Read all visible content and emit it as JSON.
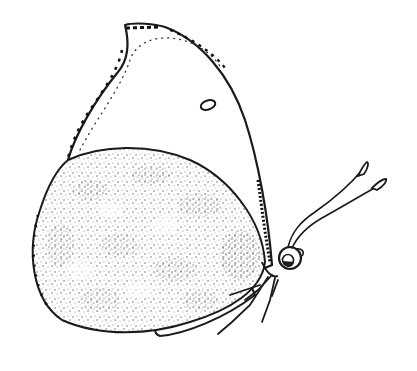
{
  "image": {
    "subject": "Butterfly, lateral (side) view, line drawing with stippled hindwing",
    "background_color": "#ffffff",
    "ink_color": "#1a1a1a"
  },
  "parts": {
    "forewing": {
      "label": "Forewing",
      "pattern": "plain with dotted submarginal line and dark marginal flecks"
    },
    "forewing_spot": {
      "label": "Forewing discal spot (small white ring)"
    },
    "hindwing": {
      "label": "Hindwing",
      "pattern": "densely stippled with mottled patches"
    },
    "head": {
      "label": "Head with eye"
    },
    "antennae": {
      "label": "Clubbed antennae",
      "count": 2
    },
    "abdomen": {
      "label": "Abdomen"
    },
    "legs": {
      "label": "Legs"
    }
  }
}
